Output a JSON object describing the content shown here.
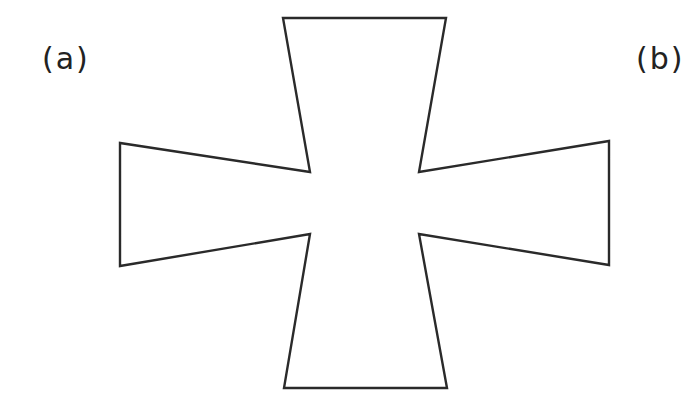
{
  "figure": {
    "labels": {
      "a": "(a)",
      "b": "(b)"
    },
    "shape": {
      "name": "cross-polygon",
      "stroke_color": "#2a2a2a",
      "fill_color": "#ffffff",
      "stroke_width": "2.4",
      "points": "283,18 446,18 419,172 609,141 609,265 419,234 447,388 284,388 310,234 120,266 120,143 310,172"
    }
  }
}
